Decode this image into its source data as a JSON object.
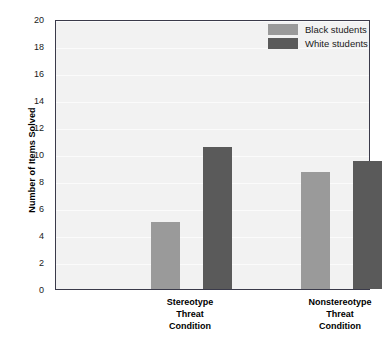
{
  "chart_data": {
    "type": "bar",
    "title": "",
    "xlabel": "",
    "ylabel": "Number of Items Solved",
    "ylim": [
      0,
      20
    ],
    "ytick_step": 2,
    "ytick_labels": [
      "0",
      "2",
      "4",
      "6",
      "8",
      "10",
      "12",
      "14",
      "16",
      "18",
      "20"
    ],
    "grid": true,
    "legend_position": "top-right",
    "categories": [
      "Stereotype\nThreat\nCondition",
      "Nonstereotype\nThreat\nCondition"
    ],
    "category_lines": [
      [
        "Stereotype",
        "Threat",
        "Condition"
      ],
      [
        "Nonstereotype",
        "Threat",
        "Condition"
      ]
    ],
    "series": [
      {
        "name": "Black students",
        "color": "#9a9a9a",
        "values": [
          5.0,
          8.7
        ]
      },
      {
        "name": "White students",
        "color": "#5a5a5a",
        "values": [
          10.5,
          9.5
        ]
      }
    ]
  },
  "legend": {
    "entries": [
      {
        "label": "Black students",
        "color": "#9a9a9a"
      },
      {
        "label": "White students",
        "color": "#5a5a5a"
      }
    ]
  },
  "axes": {
    "y_title": "Number of Items Solved"
  },
  "colors": {
    "plot_background": "#f2f2f2",
    "gridline": "#fbfbfb",
    "frame": "#3a3a4a",
    "light_bar": "#9a9a9a",
    "dark_bar": "#5a5a5a",
    "page_background": "#ffffff"
  }
}
